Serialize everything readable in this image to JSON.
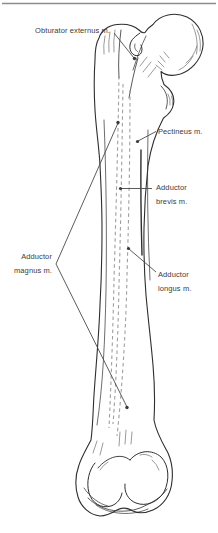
{
  "figure": {
    "type": "anatomical-line-drawing",
    "labels": {
      "obturator_externus": "Obturator externus m.",
      "pectineus": "Pectineus m.",
      "adductor_brevis": {
        "line1": "Adductor",
        "line2": "brevis m."
      },
      "adductor_magnus": {
        "line1": "Adductor",
        "line2": "magnus m."
      },
      "adductor_longus": {
        "line1": "Adductor",
        "line2": "longus m."
      }
    },
    "colors": {
      "background": "#ffffff",
      "bone_line": "#2e2e2e",
      "hatching": "#555555",
      "linea_aspera_dashes": "#9f9f9f",
      "leader_line": "#4a4a4a",
      "label_text": "#3c3c3c",
      "top_rule": "#8d8d8d"
    }
  }
}
